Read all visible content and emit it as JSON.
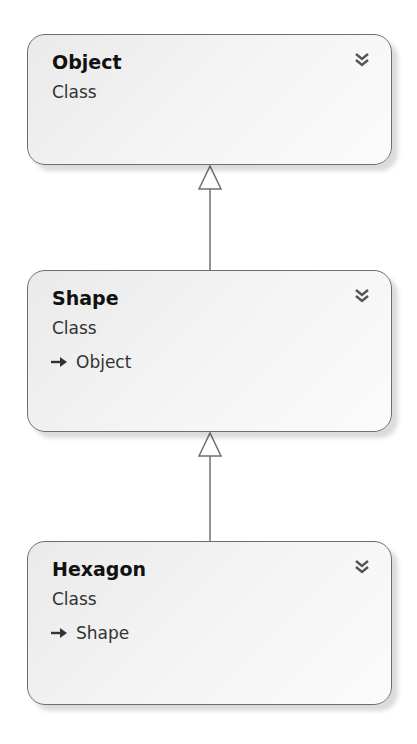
{
  "diagram": {
    "type": "class-diagram",
    "nodes": [
      {
        "id": "object",
        "name": "Object",
        "kind": "Class",
        "base": null
      },
      {
        "id": "shape",
        "name": "Shape",
        "kind": "Class",
        "base": "Object"
      },
      {
        "id": "hexagon",
        "name": "Hexagon",
        "kind": "Class",
        "base": "Shape"
      }
    ],
    "edges": [
      {
        "from": "Shape",
        "to": "Object",
        "type": "inheritance"
      },
      {
        "from": "Hexagon",
        "to": "Shape",
        "type": "inheritance"
      }
    ],
    "icons": {
      "expand": "double-chevron-down-icon",
      "base_type": "inheritance-arrow-icon"
    },
    "colors": {
      "border": "#6e6e6e",
      "box_fill": "#f2f2f2",
      "connector": "#707070"
    }
  }
}
